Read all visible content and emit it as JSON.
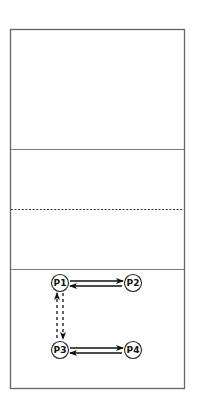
{
  "court": {
    "frame": {
      "x": 10,
      "y": 29,
      "width": 175,
      "height": 360,
      "stroke": "#666666"
    },
    "lines": [
      {
        "name": "line-1",
        "y": 149,
        "style": "solid"
      },
      {
        "name": "center-line",
        "y": 209,
        "style": "dashed"
      },
      {
        "name": "line-2",
        "y": 269,
        "style": "solid"
      }
    ]
  },
  "players": [
    {
      "id": "p1",
      "label": "P1",
      "cx": 60,
      "cy": 283
    },
    {
      "id": "p2",
      "label": "P2",
      "cx": 133,
      "cy": 283
    },
    {
      "id": "p3",
      "label": "P3",
      "cx": 60,
      "cy": 350
    },
    {
      "id": "p4",
      "label": "P4",
      "cx": 133,
      "cy": 350
    }
  ],
  "arrows": [
    {
      "from": "P1",
      "to": "P2",
      "style": "solid"
    },
    {
      "from": "P2",
      "to": "P1",
      "style": "solid"
    },
    {
      "from": "P3",
      "to": "P1",
      "style": "dashed"
    },
    {
      "from": "P1",
      "to": "P3",
      "style": "dashed"
    },
    {
      "from": "P3",
      "to": "P4",
      "style": "solid"
    },
    {
      "from": "P4",
      "to": "P3",
      "style": "solid"
    }
  ]
}
